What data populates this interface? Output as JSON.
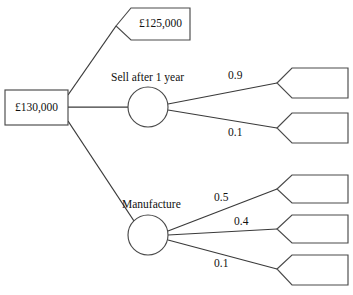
{
  "diagram": {
    "type": "decision-tree",
    "background_color": "#ffffff",
    "line_color": "#3a3a3a",
    "shape_stroke_color": "#4a4a4a",
    "text_color": "#111111",
    "root": {
      "shape": "rectangle",
      "label": "£130,000",
      "x": 5,
      "y": 90,
      "width": 63,
      "height": 35
    },
    "chance_nodes": [
      {
        "name": "sell-after-1-year",
        "caption": "Sell after 1 year",
        "caption_x": 111,
        "caption_y": 78,
        "cx": 148,
        "cy": 107,
        "r": 20
      },
      {
        "name": "manufacture",
        "caption": "Manufacture",
        "caption_x": 122,
        "caption_y": 205,
        "cx": 148,
        "cy": 235,
        "r": 20
      }
    ],
    "terminal_nodes": [
      {
        "name": "sell-now-payoff",
        "shape": "pentagon",
        "label": "£125,000",
        "tip_x": 116,
        "tip_y": 26,
        "left_x": 131,
        "right_x": 190,
        "top_y": 8,
        "bottom_y": 40
      },
      {
        "name": "sell-outcome-high",
        "shape": "pentagon",
        "label": "",
        "tip_x": 277,
        "tip_y": 83,
        "left_x": 292,
        "right_x": 348,
        "top_y": 68,
        "bottom_y": 98
      },
      {
        "name": "sell-outcome-low",
        "shape": "pentagon",
        "label": "",
        "tip_x": 277,
        "tip_y": 128,
        "left_x": 292,
        "right_x": 348,
        "top_y": 113,
        "bottom_y": 143
      },
      {
        "name": "manufacture-outcome-high",
        "shape": "pentagon",
        "label": "",
        "tip_x": 277,
        "tip_y": 189,
        "left_x": 292,
        "right_x": 348,
        "top_y": 175,
        "bottom_y": 203
      },
      {
        "name": "manufacture-outcome-mid",
        "shape": "pentagon",
        "label": "",
        "tip_x": 277,
        "tip_y": 229,
        "left_x": 292,
        "right_x": 348,
        "top_y": 215,
        "bottom_y": 243
      },
      {
        "name": "manufacture-outcome-low",
        "shape": "pentagon",
        "label": "",
        "tip_x": 277,
        "tip_y": 269,
        "left_x": 292,
        "right_x": 348,
        "top_y": 255,
        "bottom_y": 285
      }
    ],
    "branches": [
      {
        "name": "branch-root-to-sell-now",
        "x1": 68,
        "y1": 95,
        "x2": 116,
        "y2": 26,
        "label": ""
      },
      {
        "name": "branch-root-to-sell-after-1-year",
        "x1": 68,
        "y1": 107,
        "x2": 128,
        "y2": 107,
        "label": ""
      },
      {
        "name": "branch-root-to-manufacture",
        "x1": 68,
        "y1": 121,
        "x2": 134,
        "y2": 221,
        "label": ""
      },
      {
        "name": "branch-sell-high",
        "x1": 168,
        "y1": 104,
        "x2": 277,
        "y2": 83,
        "label": "0.9",
        "label_x": 228,
        "label_y": 76
      },
      {
        "name": "branch-sell-low",
        "x1": 168,
        "y1": 110,
        "x2": 277,
        "y2": 128,
        "label": "0.1",
        "label_x": 228,
        "label_y": 133
      },
      {
        "name": "branch-manufacture-high",
        "x1": 168,
        "y1": 231,
        "x2": 277,
        "y2": 189,
        "label": "0.5",
        "label_x": 214,
        "label_y": 198
      },
      {
        "name": "branch-manufacture-mid",
        "x1": 168,
        "y1": 235,
        "x2": 277,
        "y2": 229,
        "label": "0.4",
        "label_x": 234,
        "label_y": 222
      },
      {
        "name": "branch-manufacture-low",
        "x1": 168,
        "y1": 240,
        "x2": 277,
        "y2": 269,
        "label": "0.1",
        "label_x": 214,
        "label_y": 264
      }
    ]
  }
}
